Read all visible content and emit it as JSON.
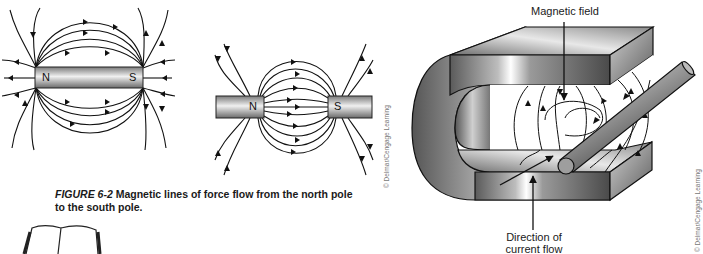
{
  "figure_left": {
    "magnet_single": {
      "north_label": "N",
      "south_label": "S"
    },
    "magnet_pair": {
      "north_label": "N",
      "south_label": "S"
    },
    "credit": "© Delmar/Cengage Learning",
    "caption": {
      "number": "FIGURE 6-2",
      "text": "Magnetic lines of force flow from the north pole to the south pole."
    }
  },
  "figure_right": {
    "labels": {
      "magnetic_field": "Magnetic field",
      "current_flow": "Direction of current flow"
    },
    "credit": "© Delmar/Cengage Learning"
  },
  "colors": {
    "line": "#111111",
    "magnet_light": "#f2f2f2",
    "magnet_dark": "#555555"
  }
}
